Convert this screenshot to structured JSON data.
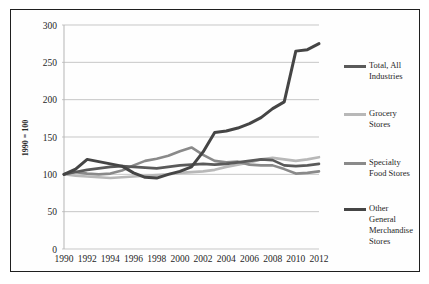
{
  "figure": {
    "ylabel": "1990 = 100"
  },
  "chart_data": {
    "type": "line",
    "title": "",
    "xlabel": "",
    "ylabel": "1990 = 100",
    "grid": "horizontal-only",
    "legend_position": "right-outside",
    "ylim": [
      0,
      300
    ],
    "yticks": [
      0,
      50,
      100,
      150,
      200,
      250,
      300
    ],
    "x": [
      1990,
      1991,
      1992,
      1993,
      1994,
      1995,
      1996,
      1997,
      1998,
      1999,
      2000,
      2001,
      2002,
      2003,
      2004,
      2005,
      2006,
      2007,
      2008,
      2009,
      2010,
      2011,
      2012
    ],
    "x_tick_labels": [
      "1990",
      "1992",
      "1994",
      "1996",
      "1998",
      "2000",
      "2002",
      "2004",
      "2006",
      "2008",
      "2010",
      "2012"
    ],
    "colors": {
      "axis_text": "#262626",
      "gridline": "#c7c7c7",
      "plot_border": "#b5b5b5"
    },
    "series": [
      {
        "name": "Total, All Industries",
        "legend_label": "Total, All\nIndustries",
        "color": "#5a5a5a",
        "stroke_width": 2.6,
        "values": [
          100,
          103,
          106,
          108,
          110,
          111,
          110,
          109,
          108,
          110,
          112,
          113,
          114,
          113,
          114,
          116,
          118,
          120,
          119,
          112,
          111,
          112,
          114
        ]
      },
      {
        "name": "Grocery Stores",
        "legend_label": "Grocery\nStores",
        "color": "#b8b8b8",
        "stroke_width": 2.6,
        "values": [
          100,
          98,
          97,
          96,
          95,
          96,
          97,
          98,
          99,
          100,
          102,
          103,
          104,
          106,
          110,
          113,
          116,
          120,
          122,
          120,
          118,
          120,
          123
        ]
      },
      {
        "name": "Specialty Food Stores",
        "legend_label": "Specialty\nFood Stores",
        "color": "#8a8a8a",
        "stroke_width": 2.6,
        "values": [
          100,
          103,
          101,
          100,
          101,
          105,
          112,
          118,
          121,
          125,
          131,
          136,
          126,
          118,
          116,
          117,
          113,
          112,
          112,
          107,
          101,
          102,
          104
        ]
      },
      {
        "name": "Other General Merchandise Stores",
        "legend_label": "Other\nGeneral\nMerchandise\nStores",
        "color": "#454545",
        "stroke_width": 3,
        "values": [
          100,
          107,
          120,
          117,
          114,
          111,
          102,
          96,
          95,
          100,
          104,
          110,
          130,
          156,
          158,
          162,
          168,
          176,
          188,
          197,
          265,
          267,
          275
        ]
      }
    ],
    "legend_item_tops": [
      50,
      98,
      147,
      193
    ]
  }
}
